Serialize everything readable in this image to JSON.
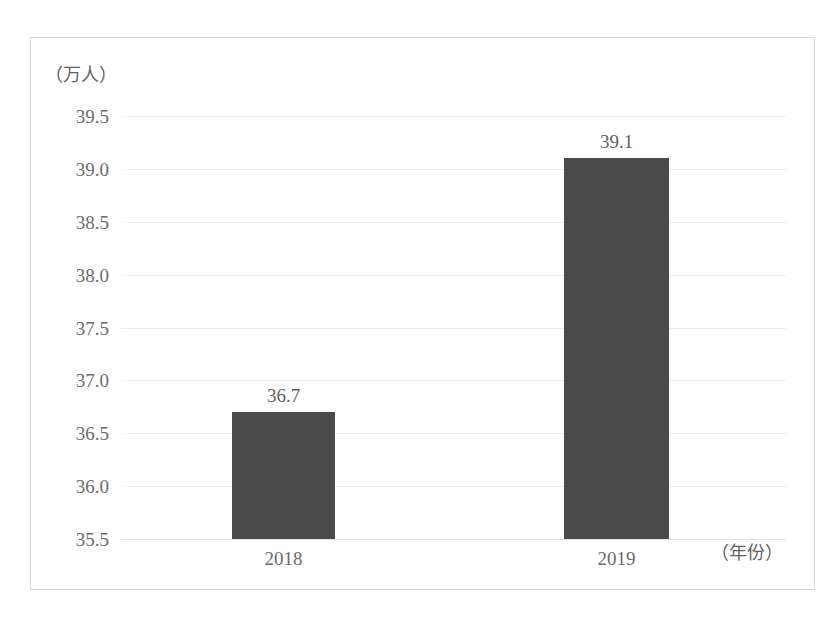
{
  "chart_data": {
    "type": "bar",
    "title": "",
    "subtitle": "",
    "xlabel": "（年份）",
    "ylabel": "（万人）",
    "categories": [
      "2018",
      "2019"
    ],
    "values": [
      36.7,
      39.1
    ],
    "data_labels": [
      "36.7",
      "39.1"
    ],
    "ylim": [
      35.5,
      39.5
    ],
    "ytick_labels": [
      "39.5",
      "39.0",
      "38.5",
      "38.0",
      "37.5",
      "37.0",
      "36.5",
      "36.0",
      "35.5"
    ],
    "ytick_values": [
      39.5,
      39.0,
      38.5,
      38.0,
      37.5,
      37.0,
      36.5,
      36.0,
      35.5
    ],
    "grid": true,
    "legend": null,
    "legend_position": "none",
    "bar_color": "#4a4a4a",
    "gridline_color": "#ededed",
    "frame_color": "#d9d9d9",
    "text_color": "#6b6b6b"
  }
}
